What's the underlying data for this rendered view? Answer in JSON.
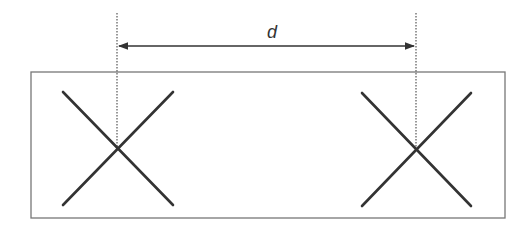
{
  "diagram": {
    "distance_label": "d",
    "marks": [
      {
        "name": "left-cross"
      },
      {
        "name": "right-cross"
      }
    ],
    "colors": {
      "stroke": "#333333",
      "frame": "#777777",
      "guide": "#555555"
    }
  }
}
